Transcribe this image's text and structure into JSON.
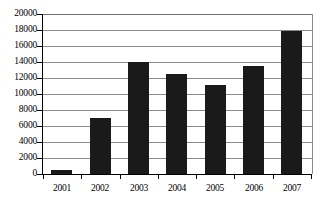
{
  "chart_data": {
    "type": "bar",
    "title": "",
    "subtitle": "",
    "xlabel": "",
    "ylabel": "",
    "categories": [
      "2001",
      "2002",
      "2003",
      "2004",
      "2005",
      "2006",
      "2007"
    ],
    "values": [
      550,
      7000,
      14000,
      12500,
      11100,
      13500,
      17900
    ],
    "series": [
      {
        "name": "",
        "values": [
          550,
          7000,
          14000,
          12500,
          11100,
          13500,
          17900
        ]
      }
    ],
    "ylim": [
      0,
      20000
    ],
    "ytick_labels": [
      "20000",
      "18000",
      "16000",
      "14000",
      "12000",
      "10000",
      "8000",
      "6000",
      "4000",
      "2000",
      "0"
    ],
    "ytick_values": [
      20000,
      18000,
      16000,
      14000,
      12000,
      10000,
      8000,
      6000,
      4000,
      2000,
      0
    ],
    "ytick_interval": 2000,
    "grid": true,
    "legend": false,
    "legend_position": "none",
    "annotations": [],
    "bar_color": "#1a1a1a",
    "grid_color": "#8a8a8a",
    "axis_color": "#000000",
    "background_color": "#ffffff"
  }
}
